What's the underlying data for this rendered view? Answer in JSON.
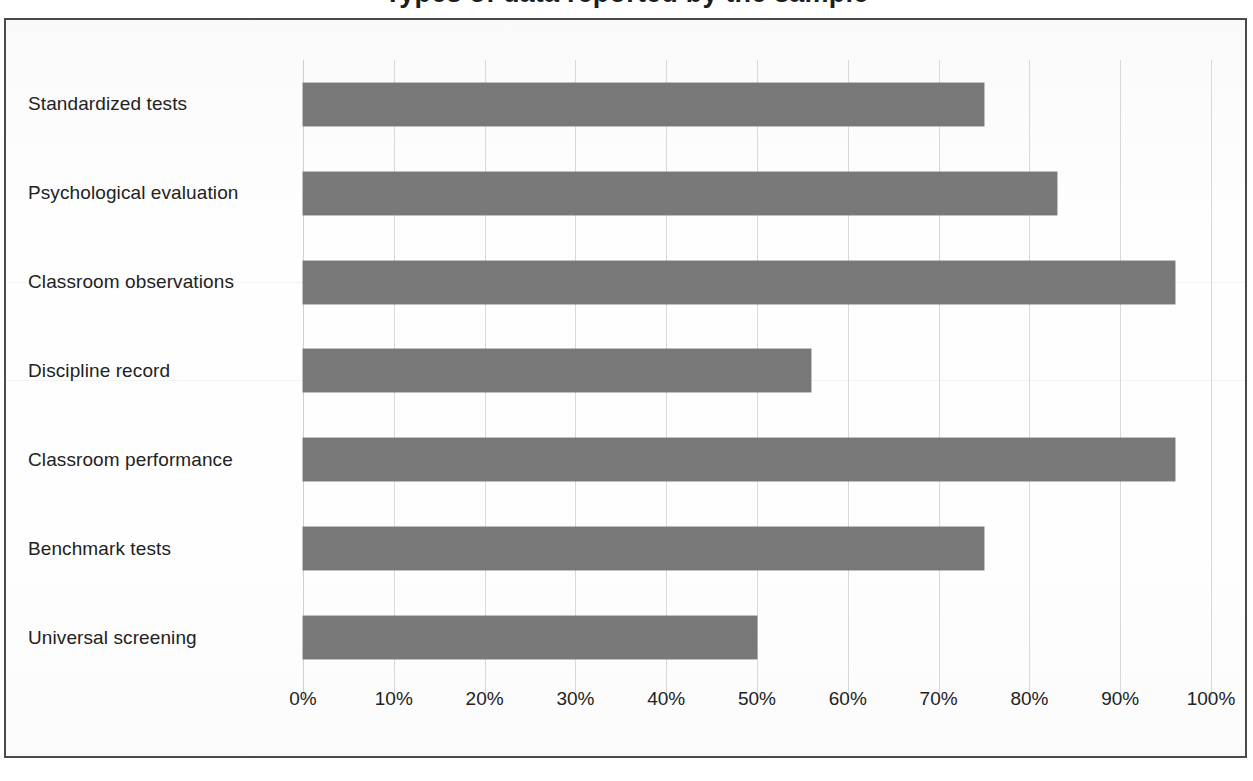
{
  "figure": {
    "title_clipped": "Types of data reported by the sample",
    "frame_color": "#4a4a4a",
    "background": "#ffffff"
  },
  "chart_data": {
    "type": "bar",
    "orientation": "horizontal",
    "title": "Types of data reported by the sample",
    "xlabel": "",
    "ylabel": "",
    "xlim": [
      0,
      100
    ],
    "grid": true,
    "legend": "none",
    "bar_color": "#787878",
    "tick_suffix": "%",
    "xticks": [
      "0%",
      "10%",
      "20%",
      "30%",
      "40%",
      "50%",
      "60%",
      "70%",
      "80%",
      "90%",
      "100%"
    ],
    "xtick_values": [
      0,
      10,
      20,
      30,
      40,
      50,
      60,
      70,
      80,
      90,
      100
    ],
    "categories": [
      "Standardized tests",
      "Psychological evaluation",
      "Classroom observations",
      "Discipline record",
      "Classroom performance",
      "Benchmark tests",
      "Universal screening"
    ],
    "values": [
      75,
      83,
      96,
      56,
      96,
      75,
      50
    ]
  }
}
